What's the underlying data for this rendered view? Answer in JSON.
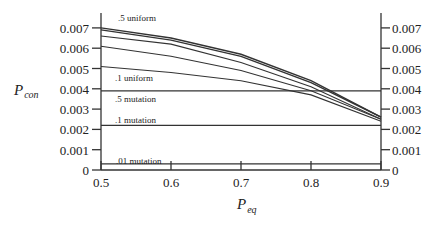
{
  "chart_data": {
    "type": "line",
    "title": "",
    "xlabel": "P_eq",
    "ylabel": "P_con",
    "x": [
      0.5,
      0.6,
      0.7,
      0.8,
      0.9
    ],
    "xlim": [
      0.5,
      0.9
    ],
    "ylim": [
      0,
      0.0075
    ],
    "x_ticks": [
      "0.5",
      "0.6",
      "0.7",
      "0.8",
      "0.9"
    ],
    "y_ticks": [
      "0",
      "0.001",
      "0.002",
      "0.003",
      "0.004",
      "0.005",
      "0.006",
      "0.007"
    ],
    "grid": false,
    "series": [
      {
        "name": ".5 uniform",
        "values": [
          0.007,
          0.0065,
          0.0057,
          0.0044,
          0.0026
        ]
      },
      {
        "name": "uniform (2)",
        "values": [
          0.0069,
          0.0064,
          0.0056,
          0.0043,
          0.0026
        ]
      },
      {
        "name": "uniform (3)",
        "values": [
          0.0066,
          0.0062,
          0.0053,
          0.0041,
          0.0025
        ]
      },
      {
        "name": "uniform (4)",
        "values": [
          0.0061,
          0.0056,
          0.0049,
          0.0039,
          0.0025
        ]
      },
      {
        "name": ".1 uniform",
        "values": [
          0.0051,
          0.0048,
          0.0044,
          0.0037,
          0.0024
        ]
      },
      {
        "name": ".5 mutation",
        "values": [
          0.0039,
          0.0039,
          0.0039,
          0.0039,
          0.0039
        ]
      },
      {
        "name": ".1 mutation",
        "values": [
          0.0022,
          0.0022,
          0.0022,
          0.0022,
          0.0022
        ]
      },
      {
        "name": ".01 mutation",
        "values": [
          0.0003,
          0.0003,
          0.0003,
          0.0003,
          0.0003
        ]
      }
    ],
    "annotations": [
      ".5 uniform",
      ".1 uniform",
      ".5 mutation",
      ".1 mutation",
      ".01 mutation"
    ]
  },
  "labels": {
    "ylabel_main": "P",
    "ylabel_sub": "con",
    "xlabel_main": "P",
    "xlabel_sub": "eq",
    "ann_05u": ".5 uniform",
    "ann_01u": ".1 uniform",
    "ann_05m": ".5 mutation",
    "ann_01m": ".1 mutation",
    "ann_001m": ".01 mutation"
  }
}
